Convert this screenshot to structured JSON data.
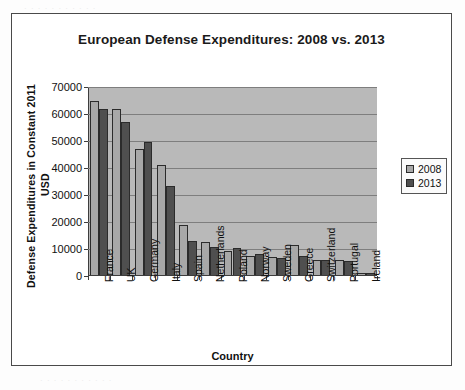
{
  "chart_data": {
    "type": "bar",
    "title": "European Defense Expenditures: 2008 vs. 2013",
    "xlabel": "Country",
    "ylabel_line1": "Defense Expenditures in Constant 2011",
    "ylabel_line2": "USD",
    "categories": [
      "France",
      "UK",
      "Germany",
      "Italy",
      "Spain",
      "Netherlands",
      "Poland",
      "Norway",
      "Sweden",
      "Greece",
      "Switzerland",
      "Portugal",
      "Ireland"
    ],
    "series": [
      {
        "name": "2008",
        "color": "#a8a8a8",
        "values": [
          65000,
          62000,
          47000,
          41000,
          18800,
          12700,
          9300,
          7500,
          7000,
          11500,
          6000,
          5800,
          1200
        ]
      },
      {
        "name": "2013",
        "color": "#4f4f4f",
        "values": [
          62000,
          57000,
          49500,
          33500,
          13000,
          10700,
          10200,
          8000,
          6700,
          7500,
          5800,
          5500,
          1100
        ]
      }
    ],
    "ylim": [
      0,
      70000
    ],
    "yticks": [
      0,
      10000,
      20000,
      30000,
      40000,
      50000,
      60000,
      70000
    ],
    "ytick_labels": [
      "0",
      "10000",
      "20000",
      "30000",
      "40000",
      "50000",
      "60000",
      "70000"
    ],
    "grid": true,
    "legend_position": "right",
    "plot_background": "#b9b9b9"
  }
}
